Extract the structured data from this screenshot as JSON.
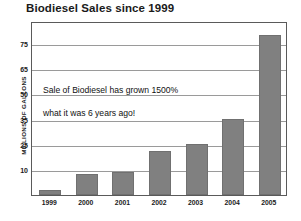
{
  "chart_data": {
    "type": "bar",
    "title": "Biodiesel Sales since 1999",
    "xlabel": "",
    "ylabel": "MILLIONS OF GALLONS",
    "categories": [
      "1999",
      "2000",
      "2001",
      "2002",
      "2003",
      "2004",
      "2005"
    ],
    "values": [
      2,
      8,
      9,
      21,
      25,
      35,
      78
    ],
    "ytick_labels": [
      "75",
      "65",
      "50",
      "35",
      "25",
      "10"
    ],
    "ytick_values": [
      75,
      65,
      50,
      35,
      25,
      10
    ],
    "ylim": [
      0,
      82
    ],
    "grid": true,
    "legend": "none",
    "bar_color": "#808080",
    "axis_color": "#5a5a5a",
    "grid_color": "#9a9a9a",
    "note": "y-axis ticks are unevenly valued but evenly spaced",
    "annotation": {
      "line1": "Sale of Biodiesel has grown 1500%",
      "line2": "what it was 6 years ago!"
    }
  }
}
